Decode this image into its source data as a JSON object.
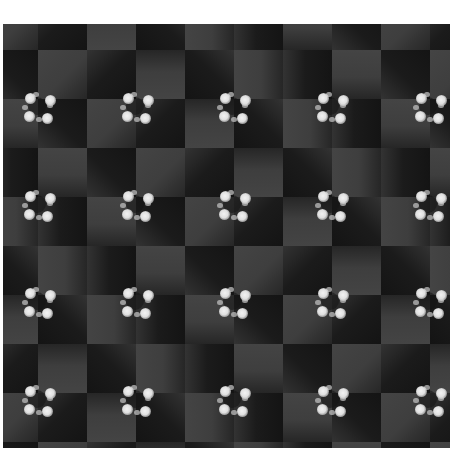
{
  "image": {
    "description": "Optical illusion: shaded checkerboard with pinwheel clusters of four white dots",
    "area": {
      "left": 3,
      "top": 24,
      "width": 447,
      "height": 424
    },
    "tile_size": 49,
    "grid_origin": {
      "x": -14,
      "y": -23
    },
    "colors": {
      "background": "#ffffff",
      "light_tile": "#444444",
      "dark_tile": "#141414",
      "dot": "#e0e0e0"
    },
    "clusters": {
      "columns_x": [
        31,
        129,
        226,
        324,
        422
      ],
      "rows_y": [
        75,
        173,
        270,
        368
      ],
      "count": 20
    }
  }
}
